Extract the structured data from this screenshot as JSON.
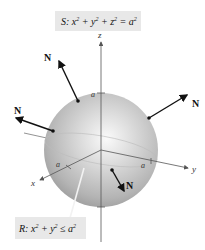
{
  "figure": {
    "surface_label": {
      "name": "S",
      "equation_parts": [
        "S: x",
        "2",
        " + y",
        "2",
        " + z",
        "2",
        " = a",
        "2"
      ]
    },
    "region_label": {
      "name": "R",
      "equation_parts": [
        "R: x",
        "2",
        " + y",
        "2",
        " ≤ a",
        "2"
      ]
    },
    "axes": {
      "x": "x",
      "y": "y",
      "z": "z"
    },
    "intercept_label": "a",
    "normal_label": "N",
    "colors": {
      "label_box": "#e8e8e8",
      "sphere_light": "#f4f4f4",
      "sphere_mid": "#c8c8c8",
      "sphere_dark": "#9a9a9a",
      "axis": "#555555",
      "arrow": "#111111"
    }
  }
}
